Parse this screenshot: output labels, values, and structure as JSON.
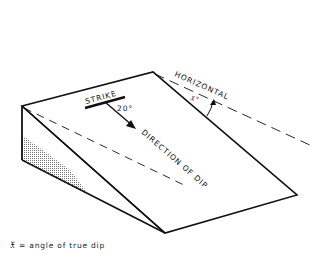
{
  "diagram": {
    "type": "block diagram of dipping plane",
    "labels": {
      "strike": "STRIKE",
      "angle": "20°",
      "direction_of_dip": "DIRECTION OF DIP",
      "horizontal": "HORIZONTAL",
      "x_angle": "𝔛°"
    },
    "caption": "𝔛 = angle of true dip",
    "colors": {
      "line": "#111111",
      "background": "#ffffff",
      "stipple": "#999999"
    }
  }
}
